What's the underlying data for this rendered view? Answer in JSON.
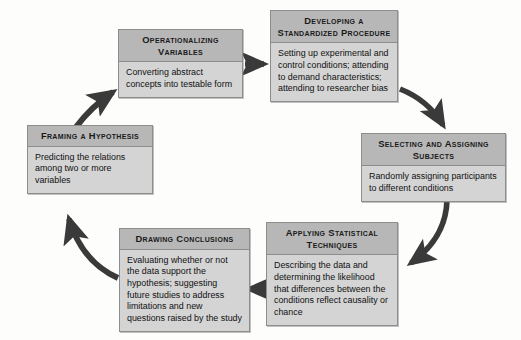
{
  "diagram": {
    "type": "cycle-flowchart",
    "colors": {
      "header_fill": "#b7b7b7",
      "body_fill": "#d4d4d4",
      "border": "#8d8d8d",
      "arrow": "#3a3a3a",
      "background": "#fdfdfc",
      "text": "#111111"
    },
    "nodes": [
      {
        "id": "operationalizing",
        "title": "Operationalizing Variables",
        "body": "Converting abstract concepts into testable form"
      },
      {
        "id": "procedure",
        "title": "Developing a Standardized Procedure",
        "body": "Setting up experimental and control conditions; attending to demand characteristics; attending to researcher bias"
      },
      {
        "id": "selecting",
        "title": "Selecting and Assigning Subjects",
        "body": "Randomly assigning participants to different conditions"
      },
      {
        "id": "statistical",
        "title": "Applying Statistical Techniques",
        "body": "Describing the data and determining the likelihood that differences between the conditions reflect causality or chance"
      },
      {
        "id": "conclusions",
        "title": "Drawing Conclusions",
        "body": "Evaluating whether or not the data support the hypothesis; suggesting future studies to address limitations and new questions raised by the study"
      },
      {
        "id": "framing",
        "title": "Framing a Hypothesis",
        "body": "Predicting the relations among two or more variables"
      }
    ],
    "arrows": [
      {
        "id": "arrow-operationalizing-to-procedure",
        "from": "operationalizing",
        "to": "procedure",
        "shape": "straight-right"
      },
      {
        "id": "arrow-procedure-to-selecting",
        "from": "procedure",
        "to": "selecting",
        "shape": "curve-down-right"
      },
      {
        "id": "arrow-selecting-to-statistical",
        "from": "selecting",
        "to": "statistical",
        "shape": "curve-down-left"
      },
      {
        "id": "arrow-statistical-to-conclusions",
        "from": "statistical",
        "to": "conclusions",
        "shape": "straight-left"
      },
      {
        "id": "arrow-conclusions-to-framing",
        "from": "conclusions",
        "to": "framing",
        "shape": "curve-up-left"
      },
      {
        "id": "arrow-framing-to-operationalizing",
        "from": "framing",
        "to": "operationalizing",
        "shape": "curve-up-right"
      }
    ]
  }
}
